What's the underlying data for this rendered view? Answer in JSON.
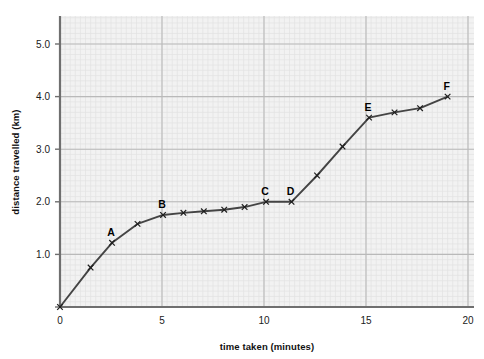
{
  "chart_data": {
    "type": "line",
    "title": "",
    "xlabel": "time taken (minutes)",
    "ylabel": "distance travelled (km)",
    "xlim": [
      0,
      20
    ],
    "ylim": [
      0,
      5.55
    ],
    "xticks": [
      0,
      5,
      10,
      15,
      20
    ],
    "xtick_labels": [
      "0",
      "5",
      "10",
      "15",
      "20"
    ],
    "yticks": [
      1.0,
      2.0,
      3.0,
      4.0,
      5.0
    ],
    "ytick_labels": [
      "1.0",
      "2.0",
      "3.0",
      "4.0",
      "5.0"
    ],
    "grid": true,
    "grid_minor": true,
    "legend": "none",
    "marker": "x",
    "line_color": "#444444",
    "grid_major_color": "#b9b9b9",
    "grid_minor_color": "#e2e2e2",
    "plot_bg_color": "#f2f2f2",
    "axis_color": "#6f6f6f",
    "x": [
      0,
      1.5,
      2.55,
      3.8,
      5.05,
      6.05,
      7.05,
      8.05,
      9.05,
      10.1,
      11.35,
      12.6,
      13.85,
      15.15,
      16.4,
      17.65,
      19.0
    ],
    "values": [
      0,
      0.75,
      1.22,
      1.58,
      1.75,
      1.79,
      1.82,
      1.85,
      1.9,
      2.0,
      2.0,
      2.5,
      3.05,
      3.6,
      3.7,
      3.78,
      4.0
    ],
    "annotations": [
      {
        "label": "A",
        "x": 2.55,
        "y": 1.22
      },
      {
        "label": "B",
        "x": 5.05,
        "y": 1.75
      },
      {
        "label": "C",
        "x": 10.1,
        "y": 2.0
      },
      {
        "label": "D",
        "x": 11.35,
        "y": 2.0
      },
      {
        "label": "E",
        "x": 15.15,
        "y": 3.6
      },
      {
        "label": "F",
        "x": 19.0,
        "y": 4.0
      }
    ]
  }
}
